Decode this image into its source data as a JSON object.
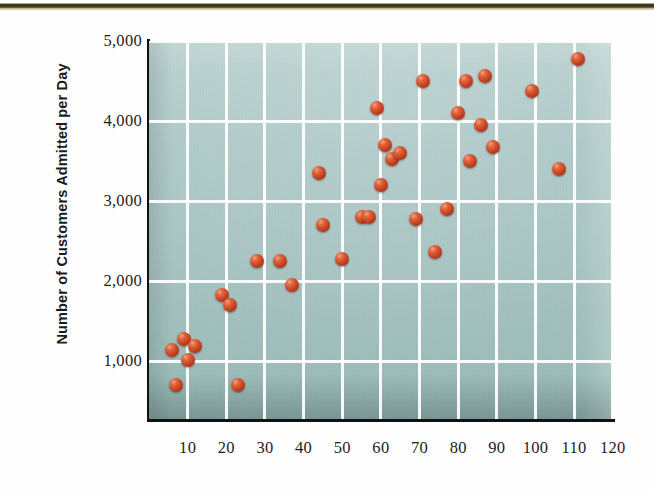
{
  "chart_data": {
    "type": "scatter",
    "title": "",
    "xlabel": "",
    "ylabel": "Number of Customers  Admitted per Day",
    "xlim": [
      0,
      123
    ],
    "ylim": [
      600,
      5000
    ],
    "grid": true,
    "legend": "none",
    "x_ticks": [
      "10",
      "20",
      "30",
      "40",
      "50",
      "60",
      "70",
      "80",
      "90",
      "100",
      "110",
      "120"
    ],
    "x_tick_values": [
      10,
      20,
      30,
      40,
      50,
      60,
      70,
      80,
      90,
      100,
      110,
      120
    ],
    "y_ticks": [
      "1,000",
      "2,000",
      "3,000",
      "4,000",
      "5,000"
    ],
    "y_tick_values": [
      1000,
      2000,
      3000,
      4000,
      5000
    ],
    "marker_color": "#cf4a26",
    "plot_background": "#a6c3c1",
    "gridline_color": "#ffffff",
    "axis_color": "#111014",
    "x": [
      6,
      7,
      9,
      10,
      12,
      19,
      21,
      23,
      28,
      29,
      34,
      36,
      44,
      45,
      50,
      54,
      57,
      58,
      59,
      60,
      63,
      65,
      66,
      69,
      71,
      74,
      77,
      80,
      82,
      86,
      88,
      90,
      99,
      106,
      107,
      111
    ],
    "y": [
      1140,
      700,
      1270,
      1010,
      1190,
      1830,
      1700,
      700,
      2250,
      2250,
      1950,
      2260,
      3350,
      2280,
      2700,
      2800,
      2800,
      4160,
      3700,
      3200,
      3520,
      3600,
      4500,
      2770,
      2360,
      4300,
      2900,
      4100,
      3500,
      3950,
      4560,
      3680,
      4370,
      3400,
      4770,
      4770
    ],
    "points": [
      {
        "x": 6,
        "y": 1140
      },
      {
        "x": 7,
        "y": 700
      },
      {
        "x": 9,
        "y": 1270
      },
      {
        "x": 10,
        "y": 1010
      },
      {
        "x": 12,
        "y": 1190
      },
      {
        "x": 19,
        "y": 1830
      },
      {
        "x": 21,
        "y": 1700
      },
      {
        "x": 23,
        "y": 700
      },
      {
        "x": 28,
        "y": 2250
      },
      {
        "x": 34,
        "y": 2250
      },
      {
        "x": 37,
        "y": 1950
      },
      {
        "x": 44,
        "y": 3350
      },
      {
        "x": 45,
        "y": 2700
      },
      {
        "x": 50,
        "y": 2280
      },
      {
        "x": 55,
        "y": 2800
      },
      {
        "x": 57,
        "y": 2800
      },
      {
        "x": 59,
        "y": 4160
      },
      {
        "x": 60,
        "y": 3200
      },
      {
        "x": 61,
        "y": 3700
      },
      {
        "x": 63,
        "y": 3520
      },
      {
        "x": 65,
        "y": 3600
      },
      {
        "x": 69,
        "y": 2770
      },
      {
        "x": 71,
        "y": 4500
      },
      {
        "x": 74,
        "y": 2360
      },
      {
        "x": 77,
        "y": 2900
      },
      {
        "x": 80,
        "y": 4100
      },
      {
        "x": 82,
        "y": 4500
      },
      {
        "x": 83,
        "y": 3500
      },
      {
        "x": 86,
        "y": 3950
      },
      {
        "x": 87,
        "y": 4560
      },
      {
        "x": 89,
        "y": 3680
      },
      {
        "x": 99,
        "y": 4370
      },
      {
        "x": 106,
        "y": 3400
      },
      {
        "x": 111,
        "y": 4770
      }
    ],
    "n_points": 34
  },
  "axes": {
    "y_title": "Number of Customers  Admitted per Day",
    "y_labels": [
      {
        "text": "5,000",
        "value": 5000
      },
      {
        "text": "4,000",
        "value": 4000
      },
      {
        "text": "3,000",
        "value": 3000
      },
      {
        "text": "2,000",
        "value": 2000
      },
      {
        "text": "1,000",
        "value": 1000
      }
    ],
    "x_labels": [
      {
        "text": "10",
        "value": 10
      },
      {
        "text": "20",
        "value": 20
      },
      {
        "text": "30",
        "value": 30
      },
      {
        "text": "40",
        "value": 40
      },
      {
        "text": "50",
        "value": 50
      },
      {
        "text": "60",
        "value": 60
      },
      {
        "text": "70",
        "value": 70
      },
      {
        "text": "80",
        "value": 80
      },
      {
        "text": "90",
        "value": 90
      },
      {
        "text": "100",
        "value": 100
      },
      {
        "text": "110",
        "value": 110
      },
      {
        "text": "120",
        "value": 120
      }
    ]
  }
}
